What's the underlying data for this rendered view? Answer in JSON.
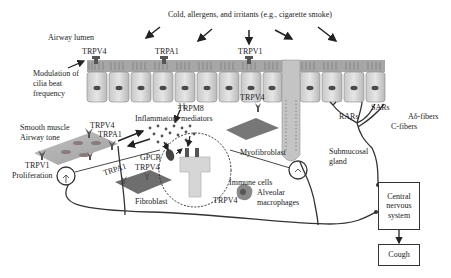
{
  "diagram": {
    "title_stimulus": "Cold, allergens, and irritants (e.g., cigarette smoke)",
    "labels": {
      "airway_lumen": "Airway lumen",
      "trpv4_top": "TRPV4",
      "trpa1_top": "TRPA1",
      "trpv1_top": "TRPV1",
      "modulation_line1": "Modulation of",
      "modulation_line2": "cilia beat",
      "modulation_line3": "frequency",
      "trpm8": "TRPM8",
      "inflammatory_mediators": "Inflammatory mediators",
      "smooth_muscle_line1": "Smooth muscle",
      "smooth_muscle_line2": "Airway tone",
      "trpv4_sm": "TRPV4",
      "trpa1_sm": "TRPA1",
      "trpv1_sm": "TRPV1",
      "proliferation": "Proliferation",
      "trpa1_fib": "TRPA1",
      "gpcr": "GPCR",
      "trpv4_fib": "TRPV4",
      "fibroblast": "Fibroblast",
      "trpv4_myo": "TRPV4",
      "myofibroblast": "Myofibroblast",
      "immune_cells": "Immune cells",
      "trpv4_immune": "TRPV4",
      "alveolar_line1": "Alveolar",
      "alveolar_line2": "macrophages",
      "submucosal_line1": "Submucosal",
      "submucosal_line2": "gland",
      "rars": "RARs",
      "sars": "SARs",
      "adelta_fibers": "Aδ-fibers",
      "c_fibers": "C-fibers"
    },
    "boxes": {
      "cns_line1": "Central",
      "cns_line2": "nervous",
      "cns_line3": "system",
      "cough": "Cough"
    },
    "colors": {
      "cell_fill": "#d9d9d9",
      "cell_shade": "#bdbdbd",
      "nucleus": "#4a4a4a",
      "tissue_fill": "#8a8a8a",
      "line": "#333333"
    }
  }
}
